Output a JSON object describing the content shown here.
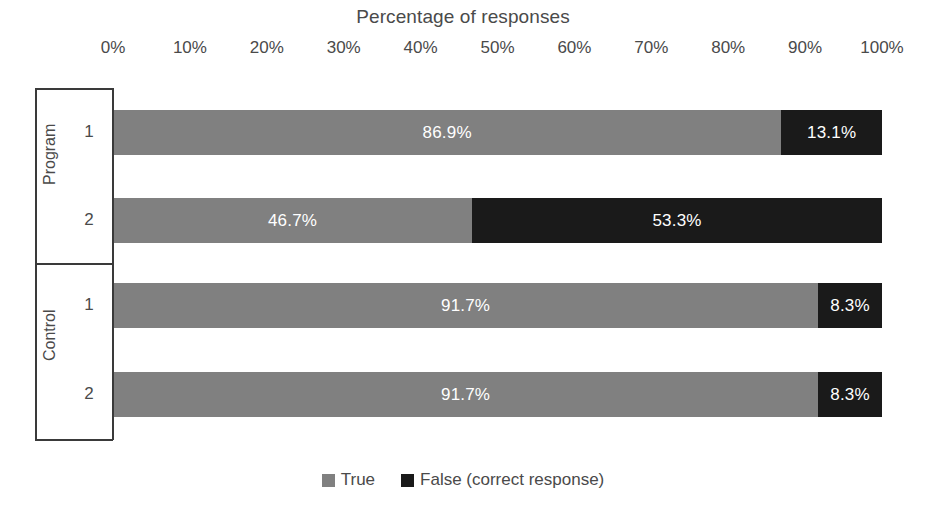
{
  "chart_data": {
    "type": "bar",
    "subtype": "100% stacked horizontal bar",
    "title": "Percentage of responses",
    "xlabel": "",
    "ylabel": "",
    "xlim": [
      0,
      100
    ],
    "xticks": [
      "0%",
      "10%",
      "20%",
      "30%",
      "40%",
      "50%",
      "60%",
      "70%",
      "80%",
      "90%",
      "100%"
    ],
    "xtick_values": [
      0,
      10,
      20,
      30,
      40,
      50,
      60,
      70,
      80,
      90,
      100
    ],
    "grid": false,
    "legend_position": "bottom-center",
    "groups": [
      {
        "name": "Program",
        "categories": [
          "1",
          "2"
        ]
      },
      {
        "name": "Control",
        "categories": [
          "1",
          "2"
        ]
      }
    ],
    "categories": [
      "Program 1",
      "Program 2",
      "Control 1",
      "Control 2"
    ],
    "series": [
      {
        "name": "True",
        "color": "#808080",
        "values": [
          86.9,
          46.7,
          91.7,
          91.7
        ],
        "labels": [
          "86.9%",
          "46.7%",
          "91.7%",
          "91.7%"
        ]
      },
      {
        "name": "False (correct response)",
        "color": "#1a1a1a",
        "values": [
          13.1,
          53.3,
          8.3,
          8.3
        ],
        "labels": [
          "13.1%",
          "53.3%",
          "8.3%",
          "8.3%"
        ]
      }
    ],
    "rows": [
      {
        "group": "Program",
        "category": "1",
        "true_value": 86.9,
        "true_label": "86.9%",
        "false_value": 13.1,
        "false_label": "13.1%"
      },
      {
        "group": "Program",
        "category": "2",
        "true_value": 46.7,
        "true_label": "46.7%",
        "false_value": 53.3,
        "false_label": "53.3%"
      },
      {
        "group": "Control",
        "category": "1",
        "true_value": 91.7,
        "true_label": "91.7%",
        "false_value": 8.3,
        "false_label": "8.3%"
      },
      {
        "group": "Control",
        "category": "2",
        "true_value": 91.7,
        "true_label": "91.7%",
        "false_value": 8.3,
        "false_label": "8.3%"
      }
    ]
  },
  "legend": {
    "items": [
      {
        "label": "True",
        "color": "#808080"
      },
      {
        "label": "False (correct response)",
        "color": "#1a1a1a"
      }
    ]
  },
  "colors": {
    "true_series": "#808080",
    "false_series": "#1a1a1a",
    "axis": "#3a3a3a",
    "text": "#4a4a4a",
    "background": "#ffffff",
    "data_label": "#ffffff"
  }
}
